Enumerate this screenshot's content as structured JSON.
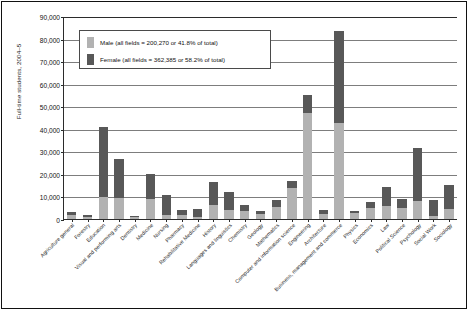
{
  "chart_data": {
    "type": "bar",
    "title": "",
    "xlabel": "",
    "ylabel": "Full-time students, 2004–5",
    "ylim": [
      0,
      90000
    ],
    "ytick_labels": [
      "90,000",
      "80,000",
      "70,000",
      "60,000",
      "50,000",
      "40,000",
      "30,000",
      "20,000",
      "10,000",
      "0"
    ],
    "ytick_values": [
      90000,
      80000,
      70000,
      60000,
      50000,
      40000,
      30000,
      20000,
      10000,
      0
    ],
    "grid": true,
    "stacked": true,
    "legend_position": "upper-left-inside",
    "categories": [
      "Agriculture general",
      "Forestry",
      "Education",
      "Visual and performing arts",
      "Dentistry",
      "Medicine",
      "Nursing",
      "Pharmacy",
      "Rehabilitative Medicine",
      "History",
      "Languages and linguistics",
      "Chemistry",
      "Geology",
      "Mathematics",
      "Computer and information science",
      "Engineering",
      "Architecture",
      "Business, management and commerce",
      "Physics",
      "Economics",
      "Law",
      "Political Science",
      "Psychology",
      "Social Work",
      "Sociology"
    ],
    "series": [
      {
        "name": "Male",
        "color": "#b2b2b2",
        "values": [
          1600,
          900,
          9900,
          9300,
          700,
          8700,
          1900,
          1700,
          1000,
          6400,
          4100,
          3600,
          2200,
          5200,
          13700,
          47200,
          2300,
          42400,
          2600,
          4900,
          5800,
          4800,
          7800,
          1300,
          4300
        ]
      },
      {
        "name": "Female",
        "color": "#585858",
        "values": [
          1500,
          700,
          30700,
          17300,
          600,
          11400,
          8900,
          2400,
          3300,
          10000,
          8000,
          2600,
          1500,
          3100,
          3300,
          8000,
          1900,
          41100,
          900,
          2700,
          8400,
          3900,
          23800,
          7300,
          10700
        ]
      }
    ],
    "totals": [
      3100,
      1600,
      40600,
      26600,
      1300,
      20100,
      10800,
      4100,
      4300,
      16400,
      12100,
      6200,
      3700,
      8300,
      17000,
      55200,
      4200,
      83500,
      3500,
      7600,
      14200,
      8700,
      31600,
      8600,
      15000
    ]
  },
  "legend": {
    "items": [
      {
        "label": "Male (all fields = 200,270 or 41.8% of total)",
        "color": "#b2b2b2"
      },
      {
        "label": "Female (all fields = 362,385 or 58.2% of total)",
        "color": "#585858"
      }
    ]
  }
}
